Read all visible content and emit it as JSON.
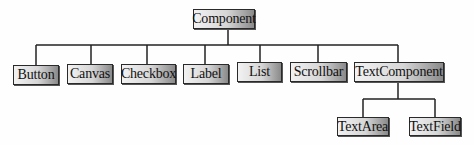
{
  "diagram": {
    "type": "class-hierarchy-tree",
    "root": {
      "label": "Component"
    },
    "children": [
      {
        "label": "Button"
      },
      {
        "label": "Canvas"
      },
      {
        "label": "Checkbox"
      },
      {
        "label": "Label"
      },
      {
        "label": "List"
      },
      {
        "label": "Scrollbar"
      },
      {
        "label": "TextComponent"
      }
    ],
    "text_component_children": [
      {
        "label": "TextArea"
      },
      {
        "label": "TextField"
      }
    ]
  }
}
